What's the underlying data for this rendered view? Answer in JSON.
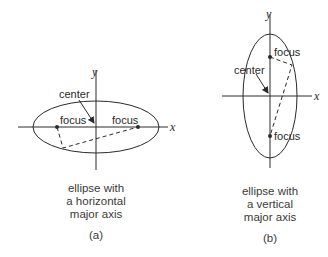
{
  "diagram_a": {
    "axis_x_label": "x",
    "axis_y_label": "y",
    "center_label": "center",
    "focus_left_label": "focus",
    "focus_right_label": "focus",
    "caption_lines": [
      "ellipse with",
      "a horizontal",
      "major axis"
    ],
    "part_label": "(a)"
  },
  "diagram_b": {
    "axis_x_label": "x",
    "axis_y_label": "y",
    "center_label": "center",
    "focus_top_label": "focus",
    "focus_bottom_label": "focus",
    "caption_lines": [
      "ellipse with",
      "a vertical",
      "major axis"
    ],
    "part_label": "(b)"
  },
  "colors": {
    "stroke": "#2a2a2a",
    "text": "#3a3a3a",
    "background": "#ffffff"
  }
}
